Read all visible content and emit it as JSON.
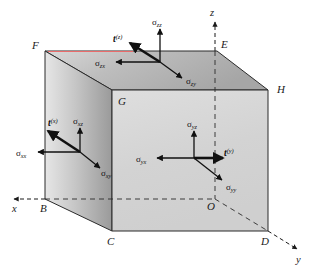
{
  "figure": {
    "background_color": "#ffffff",
    "edge_color": "#2b2b2b",
    "arrow_color": "#111111",
    "face_colors": {
      "top": "#b9b9b9",
      "left": "#a8a8a8",
      "front": "#d4d4d4",
      "highlight_edge": "#e86b6b"
    }
  },
  "axes": [
    {
      "name": "x",
      "label": "x",
      "direction": "left",
      "style": "dashed"
    },
    {
      "name": "y",
      "label": "y",
      "direction": "down-right",
      "style": "dashed"
    },
    {
      "name": "z",
      "label": "z",
      "direction": "up",
      "style": "dashed"
    }
  ],
  "vertices": [
    {
      "name": "F",
      "label": "F",
      "position": "top-back-left"
    },
    {
      "name": "E",
      "label": "E",
      "position": "top-front-left-inner"
    },
    {
      "name": "H",
      "label": "H",
      "position": "top-front-right"
    },
    {
      "name": "G",
      "label": "G",
      "position": "top-near-left"
    },
    {
      "name": "B",
      "label": "B",
      "position": "bottom-back-left"
    },
    {
      "name": "C",
      "label": "C",
      "position": "bottom-near-left"
    },
    {
      "name": "D",
      "label": "D",
      "position": "bottom-near-right"
    },
    {
      "name": "O",
      "label": "O",
      "position": "origin"
    }
  ],
  "faces": [
    {
      "name": "top-face",
      "normal": "z",
      "traction": {
        "symbol": "t",
        "superscript": "(z)"
      },
      "components": [
        {
          "symbol": "σ",
          "subscript": "zz",
          "direction": "up"
        },
        {
          "symbol": "σ",
          "subscript": "zx",
          "direction": "left"
        },
        {
          "symbol": "σ",
          "subscript": "zy",
          "direction": "down-right"
        }
      ]
    },
    {
      "name": "left-face",
      "normal": "x",
      "traction": {
        "symbol": "t",
        "superscript": "(x)"
      },
      "components": [
        {
          "symbol": "σ",
          "subscript": "xx",
          "direction": "left"
        },
        {
          "symbol": "σ",
          "subscript": "xz",
          "direction": "up"
        },
        {
          "symbol": "σ",
          "subscript": "xy",
          "direction": "down-right"
        }
      ]
    },
    {
      "name": "front-face",
      "normal": "y",
      "traction": {
        "symbol": "t",
        "superscript": "(y)"
      },
      "components": [
        {
          "symbol": "σ",
          "subscript": "yz",
          "direction": "up"
        },
        {
          "symbol": "σ",
          "subscript": "yx",
          "direction": "left"
        },
        {
          "symbol": "σ",
          "subscript": "yy",
          "direction": "down-right"
        }
      ]
    }
  ],
  "labels": {
    "sigma": "σ",
    "t": "t",
    "axis_x": "x",
    "axis_y": "y",
    "axis_z": "z",
    "vertex_B": "B",
    "vertex_C": "C",
    "vertex_D": "D",
    "vertex_E": "E",
    "vertex_F": "F",
    "vertex_G": "G",
    "vertex_H": "H",
    "vertex_O": "O",
    "sub_zz": "zz",
    "sub_zx": "zx",
    "sub_zy": "zy",
    "sub_xx": "xx",
    "sub_xz": "xz",
    "sub_xy": "xy",
    "sub_yz": "yz",
    "sub_yx": "yx",
    "sub_yy": "yy",
    "sup_x": "(x)",
    "sup_y": "(y)",
    "sup_z": "(z)"
  }
}
